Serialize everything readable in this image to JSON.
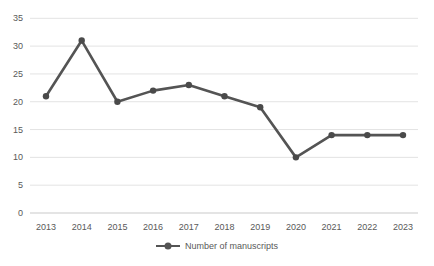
{
  "page": {
    "background": "#ffffff"
  },
  "chart_data": {
    "type": "line",
    "title": "",
    "xlabel": "",
    "ylabel": "",
    "categories": [
      "2013",
      "2014",
      "2015",
      "2016",
      "2017",
      "2018",
      "2019",
      "2020",
      "2021",
      "2022",
      "2023"
    ],
    "series": [
      {
        "name": "Number of manuscripts",
        "values": [
          21,
          31,
          20,
          22,
          23,
          21,
          19,
          10,
          14,
          14,
          14
        ]
      }
    ],
    "ylim": [
      0,
      35
    ],
    "yticks": [
      0,
      5,
      10,
      15,
      20,
      25,
      30,
      35
    ],
    "grid": true,
    "legend_position": "bottom",
    "legend_label": "Number of manuscripts",
    "colors": {
      "line": "#545454",
      "marker": "#4a4a4a",
      "grid": "#e3e3e3",
      "axis_line": "#c9c9c9",
      "tick_text": "#595959",
      "background": "#ffffff"
    }
  }
}
